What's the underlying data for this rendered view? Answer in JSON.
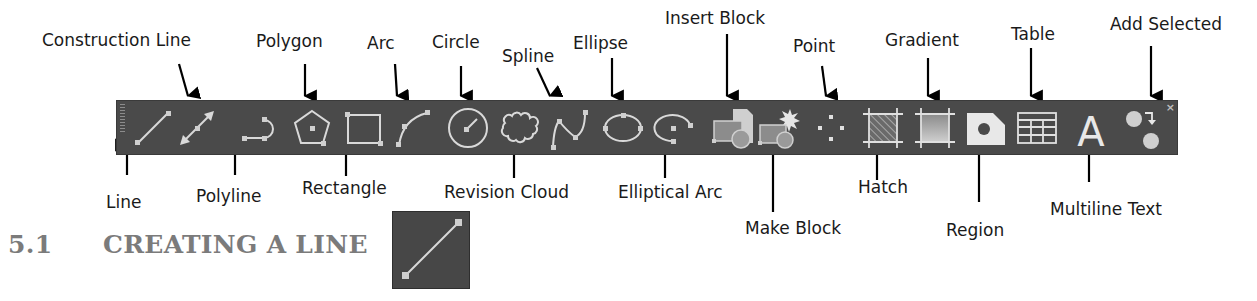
{
  "toolbar": {
    "name": "Draw toolbar",
    "background": "#4a4a4a",
    "icon_color": "#d9d9d9",
    "close_glyph": "×",
    "tools": [
      {
        "id": "line",
        "label": "Line",
        "icon": "line-icon"
      },
      {
        "id": "construction-line",
        "label": "Construction Line",
        "icon": "construction-line-icon"
      },
      {
        "id": "polyline",
        "label": "Polyline",
        "icon": "polyline-icon"
      },
      {
        "id": "polygon",
        "label": "Polygon",
        "icon": "polygon-icon"
      },
      {
        "id": "rectangle",
        "label": "Rectangle",
        "icon": "rectangle-icon"
      },
      {
        "id": "arc",
        "label": "Arc",
        "icon": "arc-icon"
      },
      {
        "id": "circle",
        "label": "Circle",
        "icon": "circle-icon"
      },
      {
        "id": "revision-cloud",
        "label": "Revision Cloud",
        "icon": "revision-cloud-icon"
      },
      {
        "id": "spline",
        "label": "Spline",
        "icon": "spline-icon"
      },
      {
        "id": "ellipse",
        "label": "Ellipse",
        "icon": "ellipse-icon"
      },
      {
        "id": "elliptical-arc",
        "label": "Elliptical Arc",
        "icon": "elliptical-arc-icon"
      },
      {
        "id": "insert-block",
        "label": "Insert Block",
        "icon": "insert-block-icon"
      },
      {
        "id": "make-block",
        "label": "Make Block",
        "icon": "make-block-icon"
      },
      {
        "id": "point",
        "label": "Point",
        "icon": "point-icon"
      },
      {
        "id": "hatch",
        "label": "Hatch",
        "icon": "hatch-icon"
      },
      {
        "id": "gradient",
        "label": "Gradient",
        "icon": "gradient-icon"
      },
      {
        "id": "region",
        "label": "Region",
        "icon": "region-icon"
      },
      {
        "id": "table",
        "label": "Table",
        "icon": "table-icon"
      },
      {
        "id": "multiline-text",
        "label": "Multiline Text",
        "icon": "multiline-text-icon"
      },
      {
        "id": "add-selected",
        "label": "Add Selected",
        "icon": "add-selected-icon"
      }
    ]
  },
  "callouts": {
    "top": {
      "construction_line": "Construction Line",
      "polygon": "Polygon",
      "arc": "Arc",
      "circle": "Circle",
      "spline": "Spline",
      "ellipse": "Ellipse",
      "insert_block": "Insert Block",
      "point": "Point",
      "gradient": "Gradient",
      "table": "Table",
      "add_selected": "Add Selected"
    },
    "bottom": {
      "line": "Line",
      "polyline": "Polyline",
      "rectangle": "Rectangle",
      "revision_cloud": "Revision Cloud",
      "elliptical_arc": "Elliptical Arc",
      "make_block": "Make Block",
      "hatch": "Hatch",
      "region": "Region",
      "multiline_text": "Multiline Text"
    }
  },
  "section": {
    "number": "5.1",
    "title": "CREATING A LINE",
    "title_color": "#7b7b7b",
    "icon": "line-icon"
  },
  "multiline_text_glyph": "A"
}
